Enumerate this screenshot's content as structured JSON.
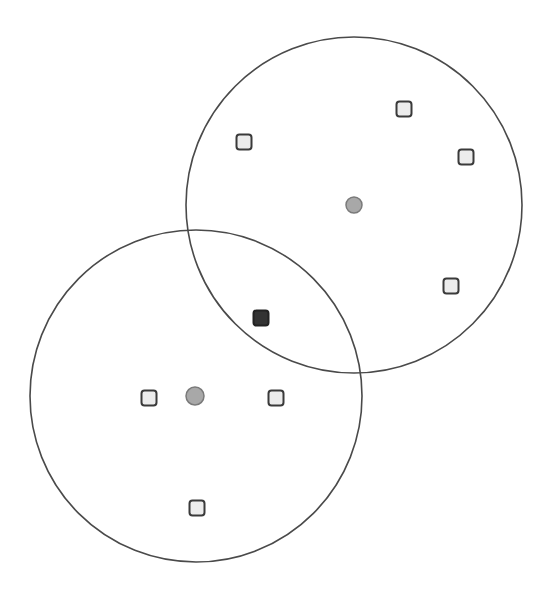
{
  "diagram": {
    "width": 547,
    "height": 594,
    "colors": {
      "background": "#ffffff",
      "circle_stroke": "#4a4a4a",
      "square_fill": "#ececec",
      "square_stroke": "#3a3a3a",
      "highlight_fill": "#333333",
      "highlight_stroke": "#222222",
      "centroid_fill": "#a8a8a8",
      "centroid_stroke": "#7a7a7a"
    },
    "clusters": [
      {
        "name": "upper-right-cluster",
        "center": {
          "x": 354,
          "y": 205
        },
        "radius": 168,
        "centroid": {
          "x": 354,
          "y": 205,
          "r": 8
        },
        "points": [
          {
            "x": 244,
            "y": 142
          },
          {
            "x": 404,
            "y": 109
          },
          {
            "x": 466,
            "y": 157
          },
          {
            "x": 451,
            "y": 286
          }
        ]
      },
      {
        "name": "lower-left-cluster",
        "center": {
          "x": 196,
          "y": 396
        },
        "radius": 166,
        "centroid": {
          "x": 195,
          "y": 396,
          "r": 9
        },
        "points": [
          {
            "x": 149,
            "y": 398
          },
          {
            "x": 276,
            "y": 398
          },
          {
            "x": 197,
            "y": 508
          }
        ]
      }
    ],
    "shared_point": {
      "x": 261,
      "y": 318,
      "label": "overlap-point"
    },
    "square_size": 15,
    "square_radius": 3
  }
}
